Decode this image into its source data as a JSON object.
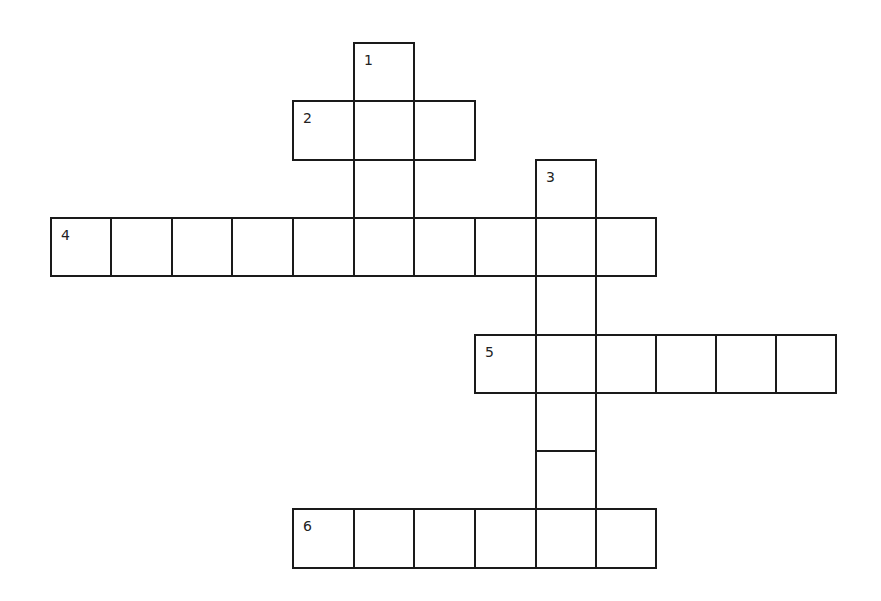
{
  "puzzle": {
    "type": "crossword",
    "cell_width": 61,
    "cell_height": 59,
    "columns_x": [
      51,
      111,
      172,
      232,
      293,
      354,
      414,
      475,
      536,
      596,
      656,
      716,
      776,
      836
    ],
    "rows_y": [
      43,
      101,
      160,
      218,
      276,
      335,
      393,
      451,
      509,
      568
    ],
    "border_color": "#1a1a1a",
    "words": [
      {
        "number": "1",
        "direction": "down",
        "start_col": 5,
        "start_row": 0,
        "length": 4
      },
      {
        "number": "2",
        "direction": "across",
        "start_col": 4,
        "start_row": 1,
        "length": 3
      },
      {
        "number": "3",
        "direction": "down",
        "start_col": 8,
        "start_row": 2,
        "length": 7
      },
      {
        "number": "4",
        "direction": "across",
        "start_col": 0,
        "start_row": 3,
        "length": 10
      },
      {
        "number": "5",
        "direction": "across",
        "start_col": 7,
        "start_row": 5,
        "length": 6
      },
      {
        "number": "6",
        "direction": "across",
        "start_col": 4,
        "start_row": 8,
        "length": 6
      }
    ]
  }
}
